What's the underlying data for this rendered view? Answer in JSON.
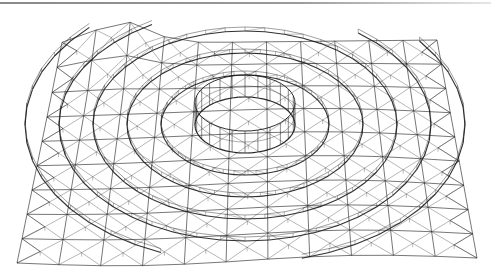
{
  "figure": {
    "background": "#ffffff",
    "line_color": "#1a1a1a",
    "top_rule_color": "#8a8a8a"
  },
  "geometry": {
    "corners": {
      "top_left": [
        62,
        44
      ],
      "top_peak": [
        124,
        20
      ],
      "top_right": [
        437,
        40
      ],
      "bottom_left": [
        17,
        263
      ],
      "bottom_right": [
        477,
        258
      ]
    },
    "grid_rows": 9,
    "grid_cols": 11,
    "ring": {
      "center": [
        245,
        125
      ],
      "rx": 50,
      "ry": 28,
      "height": 22,
      "concentric_rings": 5,
      "ring_spacing_x": 34,
      "ring_spacing_y": 22,
      "meridians": 24
    }
  }
}
